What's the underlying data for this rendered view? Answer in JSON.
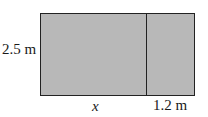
{
  "diagram": {
    "type": "rectangle-area-model",
    "fill_color": "#b8b8b8",
    "stroke_color": "#222222",
    "labels": {
      "height": "2.5 m",
      "left_width": "x",
      "right_width": "1.2 m"
    }
  }
}
